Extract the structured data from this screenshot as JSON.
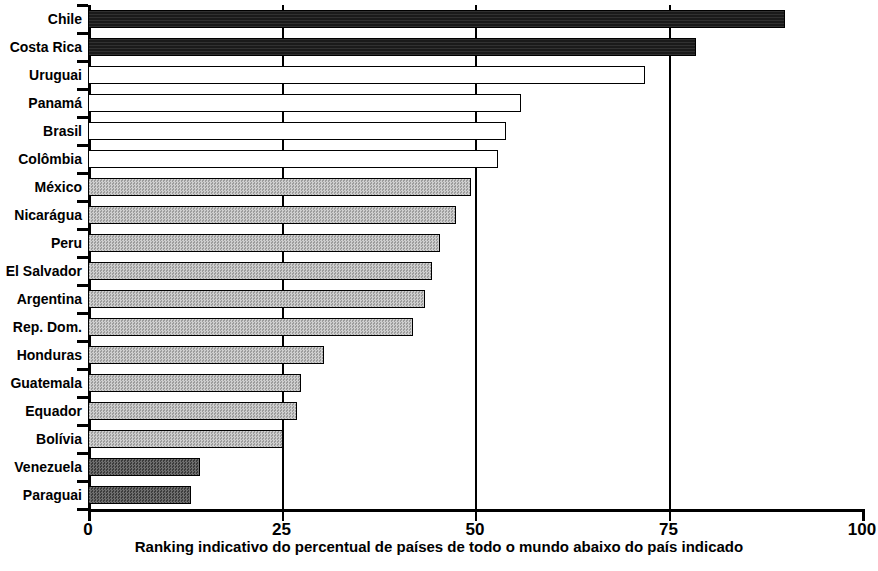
{
  "chart_data": {
    "type": "bar",
    "orientation": "horizontal",
    "title": "",
    "subtitle": "",
    "xlabel": "Ranking indicativo do percentual de países de todo o mundo abaixo do país indicado",
    "ylabel": "",
    "xlim": [
      0,
      100
    ],
    "xticks": [
      0,
      25,
      50,
      75,
      100
    ],
    "xtick_labels": [
      "0",
      "25",
      "50",
      "75",
      "100"
    ],
    "grid": "vertical gridlines at 25, 50 and 75",
    "legend": "none",
    "categories": [
      "Chile",
      "Costa Rica",
      "Uruguai",
      "Panamá",
      "Brasil",
      "Colômbia",
      "México",
      "Nicarágua",
      "Peru",
      "El Salvador",
      "Argentina",
      "Rep. Dom.",
      "Honduras",
      "Guatemala",
      "Equador",
      "Bolívia",
      "Venezuela",
      "Paraguai"
    ],
    "values": [
      90,
      78.5,
      72,
      56,
      54,
      53,
      49.5,
      47.5,
      45.5,
      44.5,
      43.5,
      42,
      30.5,
      27.5,
      27,
      25.2,
      14.5,
      13.3
    ],
    "bar_styles": [
      "black",
      "black",
      "white",
      "white",
      "white",
      "white",
      "gray",
      "gray",
      "gray",
      "gray",
      "gray",
      "gray",
      "gray",
      "gray",
      "gray",
      "gray",
      "dark-gray",
      "dark-gray"
    ]
  },
  "colors": {
    "axis": "#000000",
    "black_fill": "#1a1a1a",
    "white_fill": "#ffffff",
    "gray_fill": "#b6b6b6",
    "dark_gray_fill": "#5e5e5e"
  }
}
